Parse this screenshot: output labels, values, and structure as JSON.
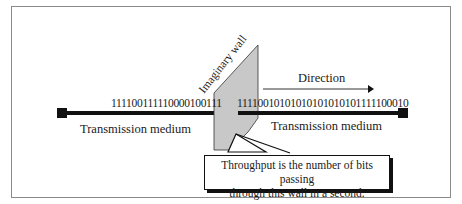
{
  "diagram": {
    "wall_label": "Imaginary wall",
    "direction_label": "Direction",
    "left_bits": "111100111110000100111",
    "right_bits": "11110010101010101010101111100010",
    "left_medium_label": "Transmission medium",
    "right_medium_label": "Transmission medium",
    "callout": {
      "line1": "Throughput is the number of bits passing",
      "line2": "through this wall in a second."
    },
    "colors": {
      "wall_fill": "#c8c8c8",
      "line": "#111111",
      "frame": "#8a8a8a"
    }
  }
}
